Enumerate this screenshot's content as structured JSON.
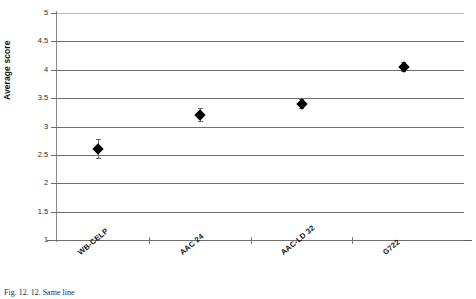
{
  "figure": {
    "caption": "Fig. 12. 12. Same line"
  },
  "chart_data": {
    "type": "scatter",
    "title": "",
    "xlabel": "",
    "ylabel": "Average score",
    "categories": [
      "WB-CELP",
      "AAC 24",
      "AAC-LD 32",
      "G722"
    ],
    "values": [
      2.6,
      3.2,
      3.4,
      4.05
    ],
    "error_low": [
      2.45,
      3.1,
      3.33,
      3.98
    ],
    "error_high": [
      2.78,
      3.32,
      3.48,
      4.13
    ],
    "ylim": [
      1,
      5
    ],
    "yticks": [
      1,
      1.5,
      2,
      2.5,
      3,
      3.5,
      4,
      4.5,
      5
    ],
    "ytick_labels": [
      "1",
      "1.5",
      "2",
      "2.5",
      "3",
      "3.5",
      "4",
      "4.5",
      "5"
    ],
    "grid": true,
    "legend": "none",
    "marker": "diamond",
    "marker_color": "#000000"
  }
}
